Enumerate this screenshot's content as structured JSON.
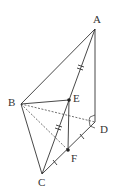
{
  "diagram": {
    "type": "tetrahedron",
    "points": {
      "A": {
        "label": "A",
        "x": 95,
        "y": 29,
        "lx": 93,
        "ly": 23
      },
      "B": {
        "label": "B",
        "x": 21,
        "y": 104,
        "lx": 8,
        "ly": 106
      },
      "C": {
        "label": "C",
        "x": 42,
        "y": 174,
        "lx": 38,
        "ly": 186
      },
      "D": {
        "label": "D",
        "x": 95,
        "y": 122,
        "lx": 100,
        "ly": 133
      },
      "E": {
        "label": "E",
        "x": 69,
        "y": 100,
        "lx": 73,
        "ly": 102
      },
      "F": {
        "label": "F",
        "x": 68,
        "y": 150,
        "lx": 71,
        "ly": 162
      }
    },
    "solid_edges": [
      "AB",
      "AD",
      "BC",
      "AC",
      "CD",
      "BE",
      "EF"
    ],
    "dashed_edges": [
      "BD",
      "BF"
    ],
    "equal_marks": {
      "AE_EC": "double",
      "CF_FD": "single"
    },
    "right_angle_at": "D",
    "line_color": "#333333"
  }
}
